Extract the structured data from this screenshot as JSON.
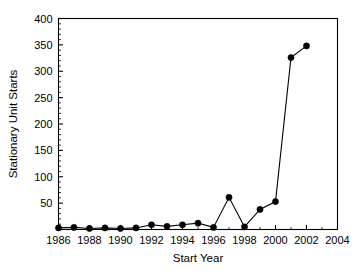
{
  "chart_data": {
    "type": "line",
    "title": "",
    "xlabel": "Start Year",
    "ylabel": "Stationary Unit Starts",
    "xlim": [
      1986,
      2004
    ],
    "ylim": [
      0,
      400
    ],
    "grid": false,
    "legend": null,
    "x_major_ticks": [
      1986,
      1988,
      1990,
      1992,
      1994,
      1996,
      1998,
      2000,
      2002,
      2004
    ],
    "x_tick_labels": [
      "1986",
      "1988",
      "1990",
      "1992",
      "1994",
      "1996",
      "1998",
      "2000",
      "2002",
      "2004"
    ],
    "x_minor_step": 1,
    "y_major_ticks": [
      0,
      50,
      100,
      150,
      200,
      250,
      300,
      350,
      400
    ],
    "y_tick_labels": [
      "0",
      "50",
      "100",
      "150",
      "200",
      "250",
      "300",
      "350",
      "400"
    ],
    "y_minor_step": 10,
    "y_labeled_ticks": [
      "50",
      "100",
      "150",
      "200",
      "250",
      "300",
      "350",
      "400"
    ],
    "marker": "filled-circle",
    "line_color": "#000000",
    "marker_color": "#000000",
    "x": [
      1986,
      1987,
      1988,
      1989,
      1990,
      1991,
      1992,
      1993,
      1994,
      1995,
      1996,
      1997,
      1998,
      1999,
      2000,
      2001,
      2002
    ],
    "values": [
      3,
      4,
      2,
      3,
      2,
      3,
      9,
      6,
      9,
      12,
      4,
      61,
      5,
      38,
      53,
      326,
      348
    ],
    "categories": [
      "1986",
      "1987",
      "1988",
      "1989",
      "1990",
      "1991",
      "1992",
      "1993",
      "1994",
      "1995",
      "1996",
      "1997",
      "1998",
      "1999",
      "2000",
      "2001",
      "2002"
    ],
    "series": [
      {
        "name": "Stationary Unit Starts",
        "values": [
          3,
          4,
          2,
          3,
          2,
          3,
          9,
          6,
          9,
          12,
          4,
          61,
          5,
          38,
          53,
          326,
          348
        ]
      }
    ]
  }
}
